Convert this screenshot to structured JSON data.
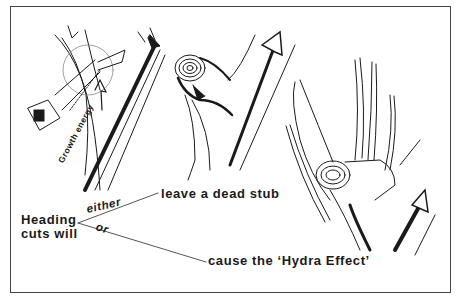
{
  "diagram": {
    "panels": [
      {
        "id": "saw-cut",
        "description": "Pruning saw making a heading cut across a branch; arrow along branch labeled growth energy"
      },
      {
        "id": "dead-stub",
        "description": "Cut branch stub with growth rings; arrow bypasses the stub"
      },
      {
        "id": "hydra-effect",
        "description": "Cut stub sprouting multiple vigorous shoots; arrow redirected into the stub"
      }
    ],
    "labels": {
      "growth_energy": "Growth energy",
      "heading_line1": "Heading",
      "heading_line2": "cuts will",
      "either": "either",
      "or": "or",
      "outcome_1": "leave a dead stub",
      "outcome_2": "cause the ‘Hydra Effect’"
    },
    "colors": {
      "ink": "#1a1a1a",
      "background": "#ffffff",
      "border": "#444444"
    }
  }
}
